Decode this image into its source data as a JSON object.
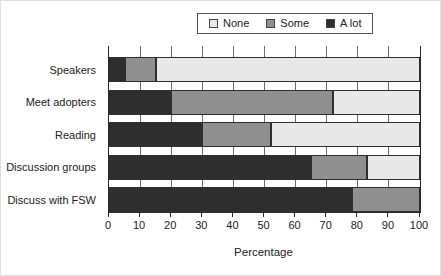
{
  "chart_data": {
    "type": "bar",
    "orientation": "horizontal",
    "stacked": true,
    "title": "",
    "xlabel": "Percentage",
    "ylabel": "",
    "xlim": [
      0,
      100
    ],
    "xticks": [
      0,
      10,
      20,
      30,
      40,
      50,
      60,
      70,
      80,
      90,
      100
    ],
    "grid": true,
    "legend_position": "top",
    "legend_order": [
      "None",
      "Some",
      "A lot"
    ],
    "categories": [
      "Speakers",
      "Meet adopters",
      "Reading",
      "Discussion groups",
      "Discuss with FSW"
    ],
    "series": [
      {
        "name": "A lot",
        "color": "#2e2e2e",
        "values": [
          5,
          20,
          30,
          65,
          78
        ]
      },
      {
        "name": "Some",
        "color": "#8f8f8f",
        "values": [
          10,
          52,
          22,
          18,
          22
        ]
      },
      {
        "name": "None",
        "color": "#e8e8e8",
        "values": [
          85,
          28,
          48,
          17,
          0
        ]
      }
    ],
    "colors": {
      "None": "#e8e8e8",
      "Some": "#8f8f8f",
      "A lot": "#2e2e2e",
      "frame": "#2a2a2a",
      "gridline": "#6e6e6e"
    }
  }
}
